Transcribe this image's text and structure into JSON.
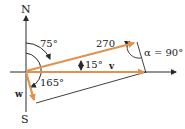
{
  "diagram": {
    "labels": {
      "north": "N",
      "south": "S",
      "angle_75": "75°",
      "angle_165": "165°",
      "angle_15": "15°",
      "magnitude_270": "270",
      "alpha": "α = 90°",
      "vector_v": "v",
      "vector_w": "w"
    },
    "colors": {
      "vector_orange": "#e0924e",
      "line_dark": "#2a2a2a",
      "background": "#ffffff"
    }
  }
}
